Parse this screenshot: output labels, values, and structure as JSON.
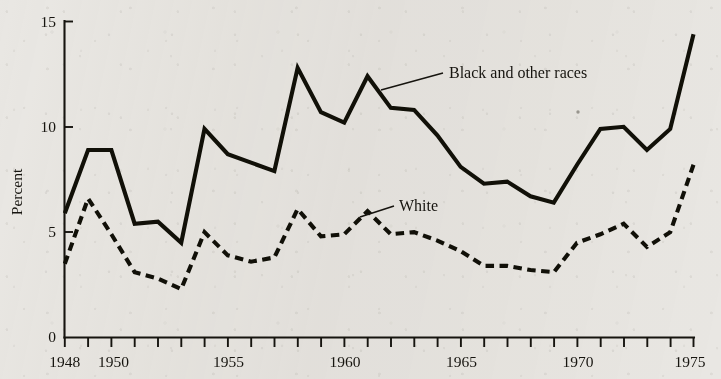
{
  "figure": {
    "background_color": "#e9e7e3",
    "ink_color": "#111008",
    "y_axis_title": "Percent"
  },
  "chart_data": {
    "type": "line",
    "title": "",
    "xlabel": "",
    "ylabel": "Percent",
    "xlim": [
      1948,
      1975
    ],
    "ylim": [
      0,
      15
    ],
    "grid": false,
    "legend_position": "inline-annotation",
    "y_ticks": [
      0,
      5,
      10,
      15
    ],
    "y_tick_labels": [
      "0",
      "5",
      "10",
      "15"
    ],
    "x_tick_labels_shown": [
      "1948",
      "1950",
      "1955",
      "1960",
      "1965",
      "1970",
      "1975"
    ],
    "x_tick_years_all": [
      1948,
      1949,
      1950,
      1951,
      1952,
      1953,
      1954,
      1955,
      1956,
      1957,
      1958,
      1959,
      1960,
      1961,
      1962,
      1963,
      1964,
      1965,
      1966,
      1967,
      1968,
      1969,
      1970,
      1971,
      1972,
      1973,
      1974,
      1975
    ],
    "x": [
      1948,
      1949,
      1950,
      1951,
      1952,
      1953,
      1954,
      1955,
      1956,
      1957,
      1958,
      1959,
      1960,
      1961,
      1962,
      1963,
      1964,
      1965,
      1966,
      1967,
      1968,
      1969,
      1970,
      1971,
      1972,
      1973,
      1974,
      1975
    ],
    "series": [
      {
        "name": "Black and other races",
        "style": "solid",
        "values": [
          5.9,
          8.9,
          8.9,
          5.4,
          5.5,
          4.5,
          9.9,
          8.7,
          8.3,
          7.9,
          12.8,
          10.7,
          10.2,
          12.4,
          10.9,
          10.8,
          9.6,
          8.1,
          7.3,
          7.4,
          6.7,
          6.4,
          8.2,
          9.9,
          10.0,
          8.9,
          9.9,
          14.4
        ]
      },
      {
        "name": "White",
        "style": "dashed",
        "values": [
          3.5,
          6.6,
          4.9,
          3.1,
          2.8,
          2.3,
          5.0,
          3.9,
          3.6,
          3.8,
          6.1,
          4.8,
          4.9,
          6.0,
          4.9,
          5.0,
          4.6,
          4.1,
          3.4,
          3.4,
          3.2,
          3.1,
          4.5,
          4.9,
          5.4,
          4.3,
          5.0,
          8.2
        ]
      }
    ],
    "annotations": [
      {
        "text": "Black and other races",
        "series": "Black and other races",
        "has_leader_line": true
      },
      {
        "text": "White",
        "series": "White",
        "has_leader_line": true
      }
    ]
  },
  "labels": {
    "y_0": "0",
    "y_5": "5",
    "y_10": "10",
    "y_15": "15",
    "x_1948": "1948",
    "x_1950": "1950",
    "x_1955": "1955",
    "x_1960": "1960",
    "x_1965": "1965",
    "x_1970": "1970",
    "x_1975": "1975",
    "series_black": "Black and other races",
    "series_white": "White",
    "axis_percent": "Percent"
  }
}
